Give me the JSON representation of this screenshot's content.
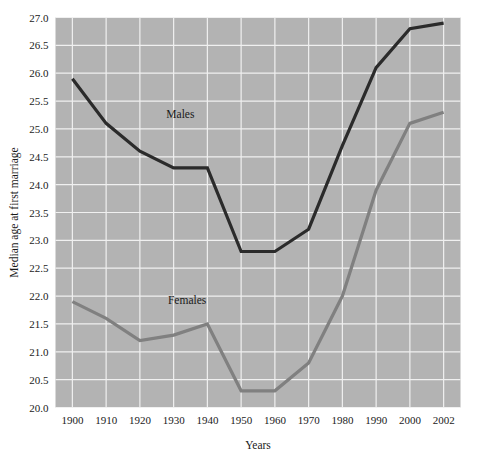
{
  "chart_data": {
    "type": "line",
    "title": "",
    "xlabel": "Years",
    "ylabel": "Median age at first marriage",
    "categories": [
      "1900",
      "1910",
      "1920",
      "1930",
      "1940",
      "1950",
      "1960",
      "1970",
      "1980",
      "1990",
      "2000",
      "2002"
    ],
    "x_tick_labels": [
      "1900",
      "1910",
      "1920",
      "1930",
      "1940",
      "1950",
      "1960",
      "1970",
      "1980",
      "1990",
      "2000",
      "2002"
    ],
    "y_tick_labels": [
      "20.0",
      "20.5",
      "21.0",
      "21.5",
      "22.0",
      "22.5",
      "23.0",
      "23.5",
      "24.0",
      "24.5",
      "25.0",
      "25.5",
      "26.0",
      "26.5",
      "27.0"
    ],
    "ylim": [
      20.0,
      27.0
    ],
    "y_tick_step": 0.5,
    "grid": true,
    "legend_position": "inline-annotation",
    "plot_background": "#b3b3b3",
    "grid_color": "#f0f0f0",
    "series": [
      {
        "name": "Males",
        "color": "#2b2b2b",
        "label_text": "Males",
        "values": [
          25.9,
          25.1,
          24.6,
          24.3,
          24.3,
          22.8,
          22.8,
          23.2,
          24.7,
          26.1,
          26.8,
          26.9
        ]
      },
      {
        "name": "Females",
        "color": "#808080",
        "label_text": "Females",
        "values": [
          21.9,
          21.6,
          21.2,
          21.3,
          21.5,
          20.3,
          20.3,
          20.8,
          22.0,
          23.9,
          25.1,
          25.3
        ]
      }
    ],
    "annotations": [
      {
        "text": "Males",
        "x_value": 1932,
        "y_value": 25.2
      },
      {
        "text": "Females",
        "x_value": 1934,
        "y_value": 21.85
      }
    ]
  }
}
